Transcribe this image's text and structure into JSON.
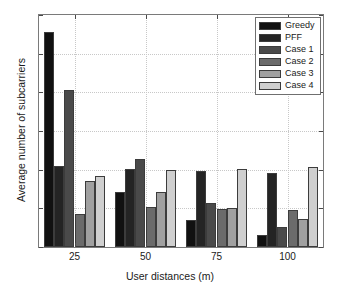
{
  "chart_data": {
    "type": "bar",
    "title": "",
    "xlabel": "User distances (m)",
    "ylabel": "Average number of subcarriers",
    "categories": [
      "25",
      "50",
      "75",
      "100"
    ],
    "series": [
      {
        "name": "Greedy",
        "color": "#111111",
        "values": [
          11.1,
          2.85,
          1.4,
          0.6
        ]
      },
      {
        "name": "PFF",
        "color": "#242424",
        "values": [
          4.2,
          4.05,
          3.95,
          3.85
        ]
      },
      {
        "name": "Case 1",
        "color": "#4a4a4a",
        "values": [
          8.1,
          4.55,
          2.3,
          1.05
        ]
      },
      {
        "name": "Case 2",
        "color": "#6b6b6b",
        "values": [
          1.7,
          2.05,
          1.95,
          1.9
        ]
      },
      {
        "name": "Case 3",
        "color": "#a0a0a0",
        "values": [
          3.4,
          2.85,
          2.0,
          1.45
        ]
      },
      {
        "name": "Case 4",
        "color": "#cfcfcf",
        "values": [
          3.65,
          4.0,
          4.05,
          4.15
        ]
      }
    ],
    "ylim": [
      0,
      12
    ],
    "yticks": [
      0,
      2,
      4,
      6,
      8,
      10,
      12
    ],
    "ytick_labels": [
      "0",
      "2",
      "4",
      "6",
      "8",
      "10",
      "12"
    ],
    "xtick_labels": [
      "25",
      "50",
      "75",
      "100"
    ],
    "grid": true,
    "legend_position": "top-right",
    "bar_edge_color": "#3c3c3c"
  }
}
